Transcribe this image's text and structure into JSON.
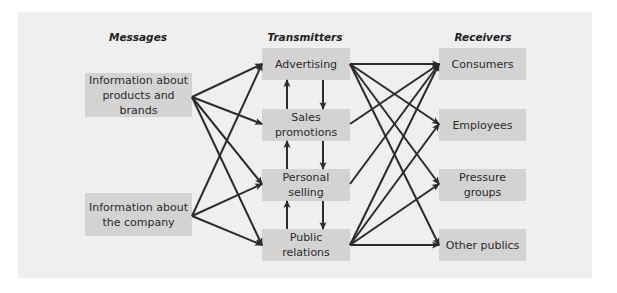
{
  "diagram": {
    "columns": {
      "messages": "Messages",
      "transmitters": "Transmitters",
      "receivers": "Receivers"
    },
    "messages": [
      {
        "id": "products",
        "label": "Information about products and brands",
        "line1": "Information about",
        "line2": "products and brands"
      },
      {
        "id": "company",
        "label": "Information about the company",
        "line1": "Information about",
        "line2": "the company"
      }
    ],
    "transmitters": [
      {
        "id": "advertising",
        "label": "Advertising"
      },
      {
        "id": "sales",
        "label": "Sales promotions"
      },
      {
        "id": "personal",
        "label": "Personal selling"
      },
      {
        "id": "pr",
        "label": "Public relations"
      }
    ],
    "receivers": [
      {
        "id": "consumers",
        "label": "Consumers"
      },
      {
        "id": "employees",
        "label": "Employees"
      },
      {
        "id": "pressure",
        "label": "Pressure groups"
      },
      {
        "id": "other",
        "label": "Other publics"
      }
    ],
    "edges": [
      [
        "products",
        "advertising"
      ],
      [
        "products",
        "sales"
      ],
      [
        "products",
        "personal"
      ],
      [
        "products",
        "pr"
      ],
      [
        "company",
        "advertising"
      ],
      [
        "company",
        "personal"
      ],
      [
        "company",
        "pr"
      ],
      [
        "advertising",
        "consumers"
      ],
      [
        "advertising",
        "employees"
      ],
      [
        "advertising",
        "pressure"
      ],
      [
        "advertising",
        "other"
      ],
      [
        "sales",
        "consumers"
      ],
      [
        "personal",
        "consumers"
      ],
      [
        "pr",
        "consumers"
      ],
      [
        "pr",
        "employees"
      ],
      [
        "pr",
        "pressure"
      ],
      [
        "pr",
        "other"
      ],
      [
        "sales",
        "advertising"
      ],
      [
        "advertising",
        "sales"
      ],
      [
        "personal",
        "sales"
      ],
      [
        "sales",
        "personal"
      ],
      [
        "pr",
        "personal"
      ],
      [
        "personal",
        "pr"
      ]
    ],
    "colors": {
      "panel": "#efefef",
      "box": "#d3d3d3",
      "arrow": "#2b2b2b"
    }
  }
}
